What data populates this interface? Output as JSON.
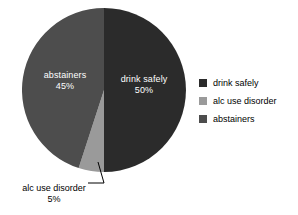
{
  "chart_data": {
    "type": "pie",
    "title": "",
    "labels": [
      "drink safely",
      "alc use disorder",
      "abstainers"
    ],
    "values": [
      50,
      5,
      45
    ],
    "value_labels": [
      "50%",
      "5%",
      "45%"
    ],
    "colors": [
      "#2b2b2b",
      "#9a9a9a",
      "#4d4d4d"
    ],
    "start_angle_deg": 0,
    "direction": "clockwise",
    "units": "percent",
    "legend_position": "right",
    "grid": false,
    "slices": [
      {
        "label": "drink safely",
        "value": 50,
        "value_label": "50%",
        "color": "#2b2b2b",
        "label_placement": "inside",
        "label_color": "#ffffff"
      },
      {
        "label": "alc use disorder",
        "value": 5,
        "value_label": "5%",
        "color": "#9a9a9a",
        "label_placement": "outside-callout",
        "label_color": "#000000"
      },
      {
        "label": "abstainers",
        "value": 45,
        "value_label": "45%",
        "color": "#4d4d4d",
        "label_placement": "inside",
        "label_color": "#ffffff"
      }
    ]
  },
  "pie_labels": {
    "drink_safely": {
      "name": "drink safely",
      "percent": "50%"
    },
    "abstainers": {
      "name": "abstainers",
      "percent": "45%"
    },
    "alc_use_disorder": {
      "name": "alc use disorder",
      "percent": "5%"
    }
  },
  "legend": {
    "items": [
      {
        "label": "drink safely",
        "color": "#2b2b2b"
      },
      {
        "label": "alc use disorder",
        "color": "#9a9a9a"
      },
      {
        "label": "abstainers",
        "color": "#4d4d4d"
      }
    ]
  },
  "background_color": "#ffffff"
}
